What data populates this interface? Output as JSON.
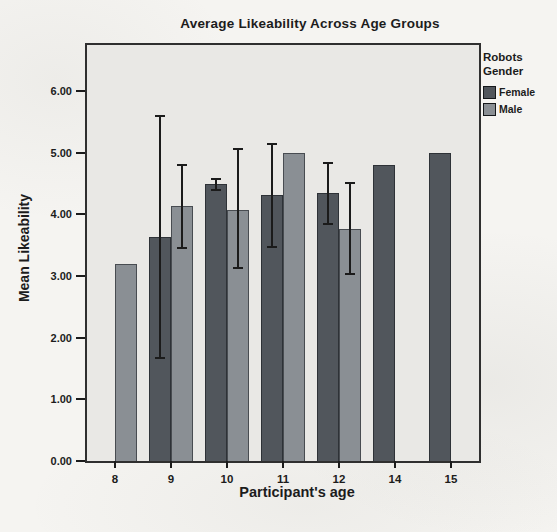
{
  "chart_data": {
    "type": "bar",
    "title": "Average Likeability Across Age Groups",
    "xlabel": "Participant's age",
    "ylabel": "Mean Likeability",
    "categories": [
      "8",
      "9",
      "10",
      "11",
      "12",
      "14",
      "15"
    ],
    "ylim": [
      0,
      6.75
    ],
    "ytick_labels": [
      "0.00",
      "1.00",
      "2.00",
      "3.00",
      "4.00",
      "5.00",
      "6.00"
    ],
    "grid": false,
    "legend": {
      "title": "Robots Gender",
      "position": "top-right-outside",
      "entries": [
        {
          "name": "Female",
          "color": "#51565c"
        },
        {
          "name": "Male",
          "color": "#8a8f94"
        }
      ]
    },
    "series": [
      {
        "name": "Female",
        "color": "#51565c",
        "values": [
          null,
          3.63,
          4.49,
          4.32,
          4.35,
          4.8,
          5.0
        ],
        "error_bars": [
          null,
          [
            1.67,
            5.6
          ],
          [
            4.4,
            4.57
          ],
          [
            3.48,
            5.14
          ],
          [
            3.84,
            4.83
          ],
          null,
          null
        ]
      },
      {
        "name": "Male",
        "color": "#8a8f94",
        "values": [
          3.2,
          4.13,
          4.08,
          5.0,
          3.76,
          null,
          null
        ],
        "error_bars": [
          null,
          [
            3.45,
            4.8
          ],
          [
            3.13,
            5.06
          ],
          null,
          [
            3.03,
            4.51
          ],
          null,
          null
        ]
      }
    ],
    "error_bar_color": "#1b1b1b",
    "plot_background": "#e9e8e5"
  }
}
